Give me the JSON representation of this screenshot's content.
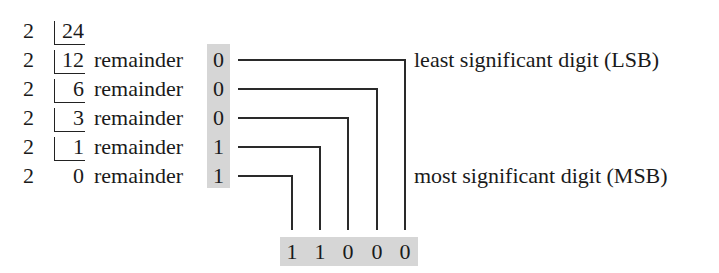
{
  "divisor": "2",
  "rows": [
    {
      "quotient": "24",
      "remainder_label": "",
      "remainder": ""
    },
    {
      "quotient": "12",
      "remainder_label": "remainder",
      "remainder": "0"
    },
    {
      "quotient": "6",
      "remainder_label": "remainder",
      "remainder": "0"
    },
    {
      "quotient": "3",
      "remainder_label": "remainder",
      "remainder": "0"
    },
    {
      "quotient": "1",
      "remainder_label": "remainder",
      "remainder": "1"
    },
    {
      "quotient": "0",
      "remainder_label": "remainder",
      "remainder": "1"
    }
  ],
  "annotations": {
    "lsb": "least significant digit (LSB)",
    "msb": "most significant digit (MSB)"
  },
  "result": [
    "1",
    "1",
    "0",
    "0",
    "0"
  ],
  "colors": {
    "highlight": "#d6d6d6",
    "ink": "#1a1a1a"
  }
}
